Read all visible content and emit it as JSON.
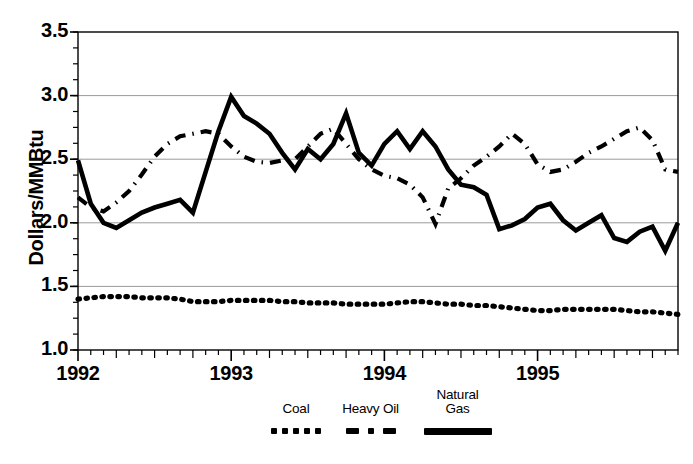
{
  "chart_data": {
    "type": "line",
    "title": "",
    "xlabel": "",
    "ylabel": "Dollars/MMBtu",
    "ylim": [
      1.0,
      3.5
    ],
    "yticks": [
      "1.0",
      "1.5",
      "2.0",
      "2.5",
      "3.0",
      "3.5"
    ],
    "ytick_values": [
      1.0,
      1.5,
      2.0,
      2.5,
      3.0,
      3.5
    ],
    "xticks": [
      "1992",
      "1993",
      "1994",
      "1995"
    ],
    "xtick_values": [
      0,
      12,
      24,
      36
    ],
    "xlim": [
      0,
      47
    ],
    "grid": "horizontal",
    "legend_position": "below",
    "x_minor_ticks": "monthly",
    "x": [
      0,
      1,
      2,
      3,
      4,
      5,
      6,
      7,
      8,
      9,
      10,
      11,
      12,
      13,
      14,
      15,
      16,
      17,
      18,
      19,
      20,
      21,
      22,
      23,
      24,
      25,
      26,
      27,
      28,
      29,
      30,
      31,
      32,
      33,
      34,
      35,
      36,
      37,
      38,
      39,
      40,
      41,
      42,
      43,
      44,
      45,
      46,
      47
    ],
    "series": [
      {
        "name": "Coal",
        "style": "dotted",
        "color": "#000000",
        "values": [
          1.4,
          1.41,
          1.42,
          1.42,
          1.42,
          1.41,
          1.41,
          1.41,
          1.4,
          1.38,
          1.38,
          1.38,
          1.39,
          1.39,
          1.39,
          1.39,
          1.38,
          1.38,
          1.37,
          1.37,
          1.37,
          1.36,
          1.36,
          1.36,
          1.36,
          1.37,
          1.38,
          1.38,
          1.37,
          1.36,
          1.36,
          1.35,
          1.35,
          1.34,
          1.33,
          1.32,
          1.31,
          1.31,
          1.32,
          1.32,
          1.32,
          1.32,
          1.32,
          1.31,
          1.3,
          1.3,
          1.29,
          1.28
        ]
      },
      {
        "name": "Heavy Oil",
        "style": "dash-dot",
        "color": "#000000",
        "values": [
          2.2,
          2.12,
          2.09,
          2.16,
          2.25,
          2.38,
          2.52,
          2.62,
          2.68,
          2.7,
          2.72,
          2.7,
          2.6,
          2.52,
          2.48,
          2.47,
          2.49,
          2.5,
          2.6,
          2.7,
          2.74,
          2.62,
          2.5,
          2.42,
          2.37,
          2.35,
          2.3,
          2.2,
          1.99,
          2.27,
          2.35,
          2.45,
          2.52,
          2.6,
          2.7,
          2.62,
          2.46,
          2.4,
          2.42,
          2.48,
          2.55,
          2.6,
          2.66,
          2.72,
          2.75,
          2.65,
          2.42,
          2.4
        ]
      },
      {
        "name": "Natural Gas",
        "style": "solid",
        "color": "#000000",
        "values": [
          2.49,
          2.15,
          2.0,
          1.96,
          2.02,
          2.08,
          2.12,
          2.15,
          2.18,
          2.08,
          2.4,
          2.72,
          2.99,
          2.84,
          2.78,
          2.7,
          2.55,
          2.42,
          2.58,
          2.5,
          2.62,
          2.86,
          2.55,
          2.45,
          2.62,
          2.72,
          2.58,
          2.72,
          2.6,
          2.42,
          2.3,
          2.28,
          2.22,
          1.95,
          1.98,
          2.03,
          2.12,
          2.15,
          2.02,
          1.94,
          2.0,
          2.06,
          1.88,
          1.85,
          1.93,
          1.97,
          1.78,
          2.0
        ]
      }
    ]
  },
  "axis": {
    "y_label": "Dollars/MMBtu"
  },
  "legend": {
    "items": [
      {
        "label_line1": "Coal",
        "label_line2": "",
        "style": "dotted"
      },
      {
        "label_line1": "Heavy Oil",
        "label_line2": "",
        "style": "dash-dot"
      },
      {
        "label_line1": "Natural",
        "label_line2": "Gas",
        "style": "solid"
      }
    ]
  }
}
